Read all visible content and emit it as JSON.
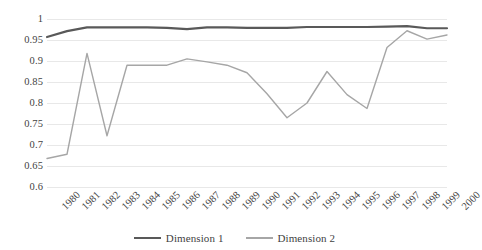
{
  "chart_data": {
    "type": "line",
    "title": "",
    "subtitle": "",
    "xlabel": "",
    "ylabel": "",
    "categories": [
      "1980",
      "1981",
      "1982",
      "1983",
      "1984",
      "1985",
      "1986",
      "1987",
      "1988",
      "1989",
      "1990",
      "1991",
      "1992",
      "1993",
      "1994",
      "1995",
      "1996",
      "1997",
      "1998",
      "1999",
      "2000"
    ],
    "x_tick_labels": [
      "1980",
      "1981",
      "1982",
      "1983",
      "1984",
      "1985",
      "1986",
      "1987",
      "1988",
      "1989",
      "1990",
      "1991",
      "1992",
      "1993",
      "1994",
      "1995",
      "1996",
      "1997",
      "1998",
      "1999",
      "2000"
    ],
    "y_tick_labels": [
      "1",
      "0.95",
      "0.9",
      "0.85",
      "0.8",
      "0.75",
      "0.7",
      "0.65",
      "0.6"
    ],
    "y_tick_values": [
      1,
      0.95,
      0.9,
      0.85,
      0.8,
      0.75,
      0.7,
      0.65,
      0.6
    ],
    "ylim": [
      0.6,
      1.0
    ],
    "grid": true,
    "legend_position": "bottom",
    "series": [
      {
        "name": "Dimension 1",
        "color": "#595959",
        "values": [
          0.957,
          0.971,
          0.98,
          0.98,
          0.98,
          0.98,
          0.979,
          0.976,
          0.98,
          0.98,
          0.979,
          0.979,
          0.979,
          0.981,
          0.981,
          0.981,
          0.981,
          0.982,
          0.983,
          0.978,
          0.978
        ]
      },
      {
        "name": "Dimension 2",
        "color": "#a6a6a6",
        "values": [
          0.668,
          0.678,
          0.918,
          0.722,
          0.89,
          0.89,
          0.89,
          0.905,
          0.898,
          0.89,
          0.872,
          0.822,
          0.765,
          0.8,
          0.875,
          0.82,
          0.787,
          0.932,
          0.972,
          0.952,
          0.962
        ]
      }
    ]
  },
  "legend": {
    "items": [
      {
        "label": "Dimension 1",
        "color": "#595959"
      },
      {
        "label": "Dimension 2",
        "color": "#a6a6a6"
      }
    ]
  },
  "colors": {
    "gridline": "#e8e8e8",
    "text": "#3f3f3f",
    "background": "#ffffff",
    "series_1": "#595959",
    "series_2": "#a6a6a6"
  }
}
